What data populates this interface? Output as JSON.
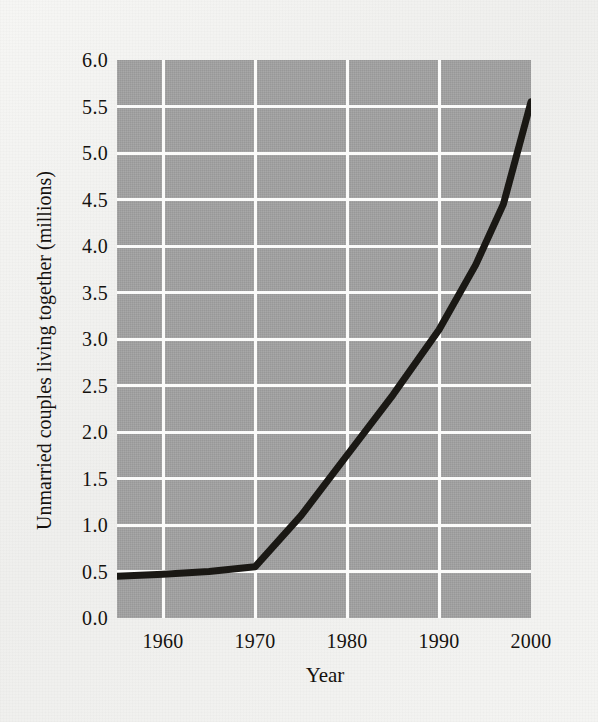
{
  "chart_data": {
    "type": "line",
    "title": "",
    "xlabel": "Year",
    "ylabel": "Unmarried couples living together (millions)",
    "xlim": [
      1955,
      2000
    ],
    "ylim": [
      0.0,
      6.0
    ],
    "grid": true,
    "legend": "none",
    "line_color": "#1a1814",
    "plot_bg_color": "#9e9e9e",
    "gridline_color": "#fbfbfa",
    "page_bg_color": "#f2f2f0",
    "xticks": [
      "1960",
      "1970",
      "1980",
      "1990",
      "2000"
    ],
    "xtick_values": [
      1960,
      1970,
      1980,
      1990,
      2000
    ],
    "yticks": [
      "0.0",
      "0.5",
      "1.0",
      "1.5",
      "2.0",
      "2.5",
      "3.0",
      "3.5",
      "4.0",
      "4.5",
      "5.0",
      "5.5",
      "6.0"
    ],
    "ytick_values": [
      0.0,
      0.5,
      1.0,
      1.5,
      2.0,
      2.5,
      3.0,
      3.5,
      4.0,
      4.5,
      5.0,
      5.5,
      6.0
    ],
    "series": [
      {
        "name": "Unmarried couples living together",
        "x": [
          1955,
          1960,
          1965,
          1970,
          1975,
          1980,
          1985,
          1990,
          1994,
          1997,
          2000
        ],
        "values": [
          0.45,
          0.47,
          0.5,
          0.55,
          1.1,
          1.75,
          2.4,
          3.1,
          3.8,
          4.45,
          5.55
        ]
      }
    ]
  }
}
